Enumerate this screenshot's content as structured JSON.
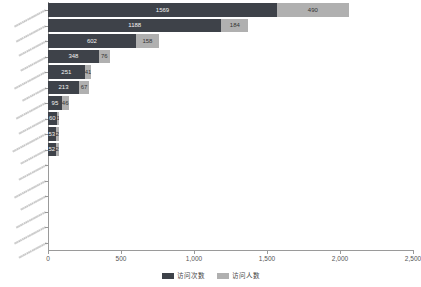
{
  "chart_data": {
    "type": "bar",
    "orientation": "horizontal",
    "stacked": true,
    "title": "",
    "xlabel": "",
    "ylabel": "",
    "xlim": [
      0,
      2500
    ],
    "xticks": [
      0,
      500,
      1000,
      1500,
      2000,
      2500
    ],
    "xticklabels": [
      "0",
      "500",
      "1,000",
      "1,500",
      "2,000",
      "2,500"
    ],
    "grid": false,
    "legend_position": "bottom",
    "categories": [
      "xxxxxxxxxxxxxxxxx",
      "xxxxxxxxxxxxxxxx",
      "xxxxxxxxxxxxxxx",
      "xxxxxxxxxxxxxx",
      "xxxxxxxxxxxxxxxxx",
      "xxxxxxxxxxxxx",
      "xxxxxxxxxxxxxxxx",
      "xxxxxxxxxxxxxxx",
      "xxxxxxxxxxxxxxxxxx",
      "xxxxxxxxxxxxxx",
      "xxxxxxxxxxxxxxx",
      "xxxxxxxxxxxxxxxxx",
      "xxxxxxxxxxxxxx",
      "xxxxxxxxxxxxxxxx",
      "xxxxxxxxxxxxxxxxx",
      "xxxxxxxxxxxxxxx"
    ],
    "series": [
      {
        "name": "访问次数",
        "color": "#3e4249",
        "values": [
          1569,
          1188,
          602,
          348,
          251,
          213,
          95,
          60,
          53,
          52,
          0,
          0,
          0,
          0,
          0,
          0
        ]
      },
      {
        "name": "访问人数",
        "color": "#b0b0b0",
        "values": [
          490,
          184,
          158,
          76,
          41,
          67,
          46,
          17,
          21,
          23,
          0,
          0,
          0,
          0,
          0,
          0
        ]
      }
    ],
    "bar_labels": {
      "访问次数": [
        "1569",
        "1188",
        "602",
        "348",
        "251",
        "213",
        "95",
        "60",
        "53",
        "52",
        "",
        "",
        "",
        "",
        "",
        ""
      ],
      "访问人数": [
        "490",
        "184",
        "158",
        "76",
        "41",
        "67",
        "46",
        "17",
        "21",
        "23",
        "",
        "",
        "",
        "",
        "",
        ""
      ]
    }
  },
  "legend": {
    "items": [
      {
        "label": "访问次数",
        "color": "#3e4249"
      },
      {
        "label": "访问人数",
        "color": "#b0b0b0"
      }
    ]
  }
}
